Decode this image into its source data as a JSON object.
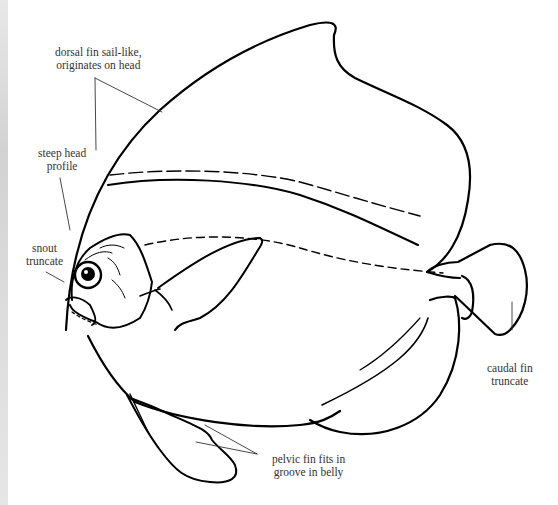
{
  "figure": {
    "labels": {
      "dorsal": [
        "dorsal fin sail-like,",
        "originates on head"
      ],
      "head": [
        "steep head",
        "profile"
      ],
      "snout": [
        "snout",
        "truncate"
      ],
      "caudal": [
        "caudal fin",
        "truncate"
      ],
      "pelvic": [
        "pelvic fin fits in",
        "groove in belly"
      ]
    },
    "colors": {
      "line": "#000000",
      "label_text": "#333333",
      "leader": "#333333",
      "background": "#ffffff"
    }
  }
}
